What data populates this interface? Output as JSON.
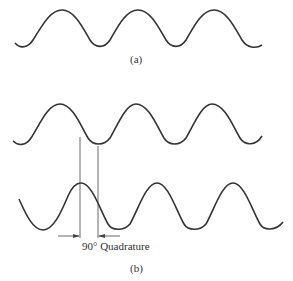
{
  "figure": {
    "part_a": {
      "label": "(a)"
    },
    "part_b": {
      "label": "(b)",
      "annotation": "90° Quadrature"
    }
  },
  "colors": {
    "stroke": "#333333",
    "background": "#ffffff"
  }
}
